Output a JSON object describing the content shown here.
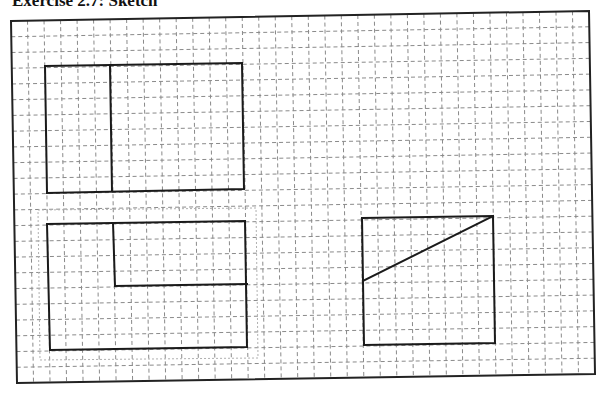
{
  "header": {
    "title": "Exercise 2.7: Sketch"
  },
  "sheet": {
    "border": {
      "tl": [
        11,
        21
      ],
      "tr": [
        589,
        11
      ],
      "br": [
        595,
        374
      ],
      "bl": [
        17,
        383
      ]
    },
    "grid": {
      "columns": 35,
      "rows": 23,
      "style": "dashed",
      "color": "#8a8a8a"
    }
  },
  "shapes": [
    {
      "id": "rect-vertical-split",
      "outline": [
        [
          45,
          66
        ],
        [
          242,
          63
        ],
        [
          244,
          189
        ],
        [
          47,
          193
        ]
      ],
      "lines": [
        [
          [
            110,
            65
          ],
          [
            112,
            191
          ]
        ]
      ]
    },
    {
      "id": "rect-l-notch",
      "outline": [
        [
          47,
          224
        ],
        [
          245,
          221
        ],
        [
          247,
          347
        ],
        [
          50,
          350
        ]
      ],
      "lines": [
        [
          [
            113,
            223
          ],
          [
            115,
            286
          ]
        ],
        [
          [
            115,
            286
          ],
          [
            247,
            284
          ]
        ]
      ],
      "faint_box": [
        [
          38,
          210
        ],
        [
          256,
          208
        ],
        [
          258,
          358
        ],
        [
          40,
          360
        ]
      ]
    },
    {
      "id": "square-diagonal",
      "outline": [
        [
          362,
          218
        ],
        [
          493,
          216
        ],
        [
          495,
          343
        ],
        [
          364,
          345
        ]
      ],
      "lines": [
        [
          [
            363,
            281
          ],
          [
            493,
            216
          ]
        ]
      ]
    }
  ],
  "colors": {
    "ink": "#1a1a1a",
    "grid": "#8a8a8a",
    "paper": "#ffffff"
  }
}
